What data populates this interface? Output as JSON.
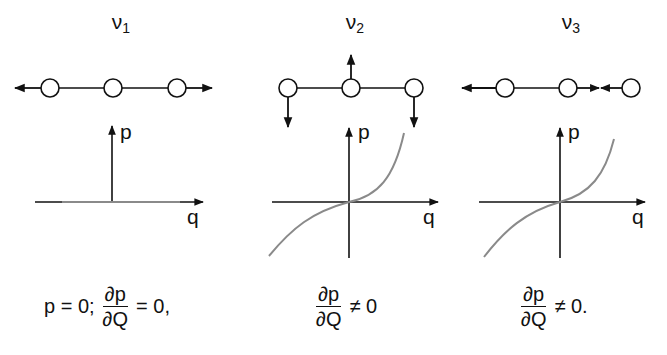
{
  "figure": {
    "panels": [
      {
        "id": "v1",
        "title_main": "ν",
        "title_sub": "1",
        "mode_description": "outer atoms move outward along the chain axis",
        "axis_x_label": "q",
        "axis_y_label": "p",
        "curve": "p = 0 (flat)",
        "equation": {
          "prefix": "p = 0;",
          "numerator": "∂p",
          "denominator": "∂Q",
          "suffix": "= 0,"
        }
      },
      {
        "id": "v2",
        "title_main": "ν",
        "title_sub": "2",
        "mode_description": "center atom up, outer atoms down (bending)",
        "axis_x_label": "q",
        "axis_y_label": "p",
        "curve": "cubic-like through origin",
        "equation": {
          "prefix": "",
          "numerator": "∂p",
          "denominator": "∂Q",
          "suffix": "≠ 0"
        }
      },
      {
        "id": "v3",
        "title_main": "ν",
        "title_sub": "3",
        "mode_description": "asymmetric stretch",
        "axis_x_label": "q",
        "axis_y_label": "p",
        "curve": "cubic-like through origin",
        "equation": {
          "prefix": "",
          "numerator": "∂p",
          "denominator": "∂Q",
          "suffix": "≠ 0."
        }
      }
    ],
    "colors": {
      "ink": "#111111",
      "curve": "#8a8a8a",
      "atom_fill": "#ffffff"
    }
  }
}
